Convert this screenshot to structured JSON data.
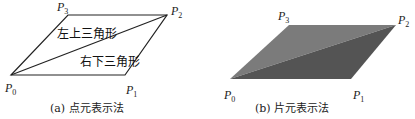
{
  "figure_a": {
    "caption": "(a) 点元表示法",
    "vertices": {
      "P0": "P",
      "P1": "P",
      "P2": "P",
      "P3": "P"
    },
    "subs": {
      "P0": "0",
      "P1": "1",
      "P2": "2",
      "P3": "3"
    },
    "upper_triangle_label": "左上三角形",
    "lower_triangle_label": "右下三角形",
    "stroke_color": "#222222"
  },
  "figure_b": {
    "caption": "(b) 片元表示法",
    "subs": {
      "P0": "0",
      "P1": "1",
      "P2": "2",
      "P3": "3"
    },
    "upper_fill": "#7b7b7b",
    "lower_fill": "#545454"
  }
}
